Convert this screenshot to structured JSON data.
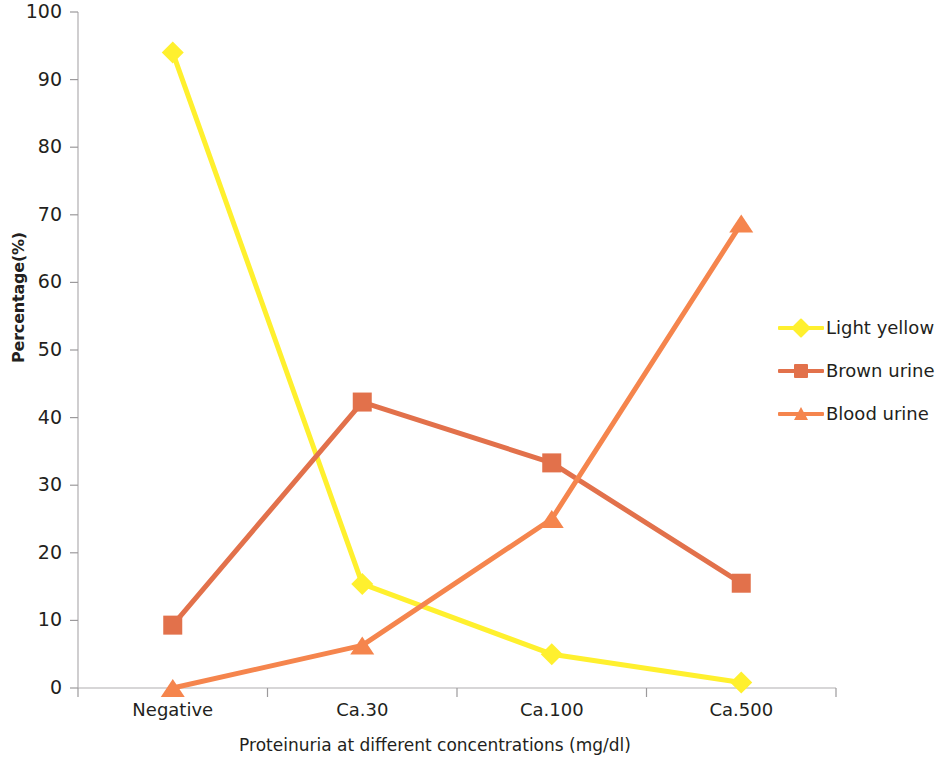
{
  "chart_data": {
    "type": "line",
    "title": "",
    "xlabel": "Proteinuria at different concentrations (mg/dl)",
    "ylabel": "Percentage(%)",
    "categories": [
      "Negative",
      "Ca.30",
      "Ca.100",
      "Ca.500"
    ],
    "ylim": [
      0,
      100
    ],
    "yticks": [
      0,
      10,
      20,
      30,
      40,
      50,
      60,
      70,
      80,
      90,
      100
    ],
    "ytick_labels": [
      "0",
      "10",
      "20",
      "30",
      "40",
      "50",
      "60",
      "70",
      "80",
      "90",
      "100"
    ],
    "grid": false,
    "legend_position": "right",
    "series": [
      {
        "name": "Light yellow",
        "color": "#FFF02E",
        "marker": "diamond",
        "values": [
          94.0,
          15.4,
          5.0,
          0.8
        ]
      },
      {
        "name": "Brown urine",
        "color": "#E2714B",
        "marker": "square",
        "values": [
          9.3,
          42.3,
          33.3,
          15.5
        ]
      },
      {
        "name": "Blood urine",
        "color": "#F5854D",
        "marker": "triangle",
        "values": [
          0.0,
          6.3,
          25.0,
          68.7
        ]
      }
    ]
  },
  "axis": {
    "line_color": "#B0AEB0",
    "tick_color": "#9C9A9C"
  }
}
